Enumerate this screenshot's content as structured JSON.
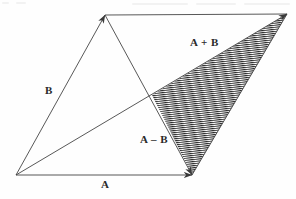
{
  "figure": {
    "background_color": "#fefefe",
    "line_color": "#3a3a3a",
    "hatch_color": "#2b2b2b",
    "label_color": "#2a2a2a",
    "points": {
      "origin": {
        "x": 16,
        "y": 175
      },
      "tip_b": {
        "x": 105,
        "y": 15
      },
      "tip_a": {
        "x": 192,
        "y": 175
      },
      "tip_a_plus_b": {
        "x": 287,
        "y": 14
      },
      "crossing": {
        "x": 152,
        "y": 95
      }
    },
    "labels": {
      "a": "A",
      "b": "B",
      "a_plus_b": "A + B",
      "a_minus_b": "A – B"
    },
    "shaded_region": {
      "name": "a-minus-b-triangle",
      "fill": "hatch",
      "vertices": [
        {
          "x": 152,
          "y": 95
        },
        {
          "x": 287,
          "y": 14
        },
        {
          "x": 192,
          "y": 175
        }
      ]
    }
  }
}
